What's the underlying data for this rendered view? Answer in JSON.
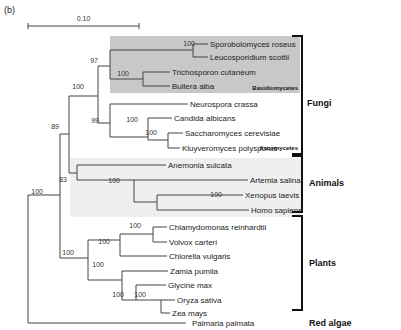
{
  "panel_label": "(b)",
  "scale_bar": {
    "label": "0.10",
    "x1": 28,
    "x2": 139,
    "y": 26
  },
  "colors": {
    "basidio_box": "#c8c8c8",
    "animals_box": "#efefef",
    "branch": "#444444",
    "bracket": "#111111"
  },
  "boxes": [
    {
      "name": "basidiomycetes-box",
      "x": 110,
      "y": 36,
      "w": 190,
      "h": 57,
      "color": "#c8c8c8"
    },
    {
      "name": "animals-box",
      "x": 70,
      "y": 158,
      "w": 232,
      "h": 59,
      "color": "#efefef"
    }
  ],
  "taxa": [
    {
      "id": "sporobolomyces",
      "label": "Sporobolomyces roseus",
      "x": 210,
      "y": 44
    },
    {
      "id": "leucosporidium",
      "label": "Leucosporidium scottii",
      "x": 210,
      "y": 57
    },
    {
      "id": "trichosporon",
      "label": "Trichosporon cutaneum",
      "x": 172,
      "y": 72
    },
    {
      "id": "bullera",
      "label": "Bullera alba",
      "x": 172,
      "y": 86
    },
    {
      "id": "neurospora",
      "label": "Neurospora crassa",
      "x": 190,
      "y": 104
    },
    {
      "id": "candida",
      "label": "Candida albicans",
      "x": 174,
      "y": 118
    },
    {
      "id": "saccharomyces",
      "label": "Saccharomyces cerevisiae",
      "x": 185,
      "y": 133
    },
    {
      "id": "kluyveromyces",
      "label": "Kluyveromyces polysporus",
      "x": 182,
      "y": 148
    },
    {
      "id": "anemonia",
      "label": "Anemonia sulcata",
      "x": 168,
      "y": 165
    },
    {
      "id": "artemia",
      "label": "Artemia salina",
      "x": 250,
      "y": 180
    },
    {
      "id": "xenopus",
      "label": "Xenopus laevis",
      "x": 245,
      "y": 195
    },
    {
      "id": "homo",
      "label": "Homo sapiens",
      "x": 251,
      "y": 210
    },
    {
      "id": "chlamydomonas",
      "label": "Chlamydomonas reinhardtii",
      "x": 169,
      "y": 227
    },
    {
      "id": "volvox",
      "label": "Volvox carteri",
      "x": 169,
      "y": 242
    },
    {
      "id": "chlorella",
      "label": "Chlorella vulgaris",
      "x": 169,
      "y": 256
    },
    {
      "id": "zamia",
      "label": "Zamia pumila",
      "x": 170,
      "y": 271
    },
    {
      "id": "glycine",
      "label": "Glycine max",
      "x": 168,
      "y": 285
    },
    {
      "id": "oryza",
      "label": "Oryza sativa",
      "x": 177,
      "y": 300
    },
    {
      "id": "zea",
      "label": "Zea mays",
      "x": 172,
      "y": 313
    },
    {
      "id": "palmaria",
      "label": "Palmaria palmata",
      "x": 192,
      "y": 323
    }
  ],
  "bootstrap": [
    {
      "value": "100",
      "x": 195,
      "y": 46
    },
    {
      "value": "97",
      "x": 98,
      "y": 63
    },
    {
      "value": "100",
      "x": 129,
      "y": 76
    },
    {
      "value": "100",
      "x": 84,
      "y": 89
    },
    {
      "value": "99",
      "x": 99,
      "y": 123
    },
    {
      "value": "100",
      "x": 138,
      "y": 122
    },
    {
      "value": "100",
      "x": 157,
      "y": 135
    },
    {
      "value": "89",
      "x": 59,
      "y": 129
    },
    {
      "value": "83",
      "x": 67,
      "y": 182
    },
    {
      "value": "100",
      "x": 120,
      "y": 183
    },
    {
      "value": "100",
      "x": 222,
      "y": 197
    },
    {
      "value": "100",
      "x": 141,
      "y": 228
    },
    {
      "value": "100",
      "x": 110,
      "y": 244
    },
    {
      "value": "100",
      "x": 74,
      "y": 255
    },
    {
      "value": "100",
      "x": 104,
      "y": 267
    },
    {
      "value": "100",
      "x": 43,
      "y": 194
    },
    {
      "value": "100",
      "x": 124,
      "y": 297
    },
    {
      "value": "100",
      "x": 146,
      "y": 297
    }
  ],
  "groups": [
    {
      "label": "Fungi",
      "x": 307,
      "y": 103,
      "bracket": {
        "x": 302,
        "y1": 36,
        "y2": 154
      }
    },
    {
      "label": "Animals",
      "x": 309,
      "y": 183,
      "bracket": {
        "x": 302,
        "y1": 156,
        "y2": 212
      }
    },
    {
      "label": "Plants",
      "x": 309,
      "y": 263,
      "bracket": {
        "x": 302,
        "y1": 216,
        "y2": 310
      }
    },
    {
      "label": "Red algae",
      "x": 309,
      "y": 323,
      "bracket": null
    }
  ],
  "subgroups": [
    {
      "label": "Basidiomycetes",
      "x": 298,
      "y": 90
    },
    {
      "label": "Ascomycetes",
      "x": 298,
      "y": 150
    }
  ],
  "branches": [
    "M28,195 V323 H186",
    "M28,195 H60",
    "M60,134 V258",
    "M60,134 H69",
    "M69,96 V173",
    "M69,96 H98",
    "M98,66 V123",
    "M98,66 H110",
    "M110,50 V79",
    "M110,50 H193",
    "M193,44 V57",
    "M193,44 H208",
    "M193,57 H208",
    "M110,79 H143",
    "M143,72 V86",
    "M143,72 H170",
    "M143,86 H170",
    "M98,123 H110",
    "M110,104 V137",
    "M110,104 H188",
    "M110,137 H148",
    "M148,118 V140",
    "M148,118 H172",
    "M148,140 H168",
    "M168,133 V148",
    "M168,133 H183",
    "M168,148 H180",
    "M69,173 H77",
    "M77,165 V180",
    "M77,165 H166",
    "M77,180 H134",
    "M134,180 V202",
    "M134,180 H248",
    "M134,202 H157",
    "M157,195 V210",
    "M157,195 H243",
    "M157,210 H249",
    "M60,258 H88",
    "M88,240 V280",
    "M88,240 H120",
    "M120,234 V256",
    "M120,234 H153",
    "M153,227 V242",
    "M153,227 H167",
    "M153,242 H167",
    "M120,256 H167",
    "M88,280 H122",
    "M122,271 V300",
    "M122,271 H168",
    "M122,300 H136",
    "M136,285 V300",
    "M136,285 H166",
    "M136,300 H161",
    "M161,300 V313",
    "M161,300 H175",
    "M161,313 H170"
  ]
}
